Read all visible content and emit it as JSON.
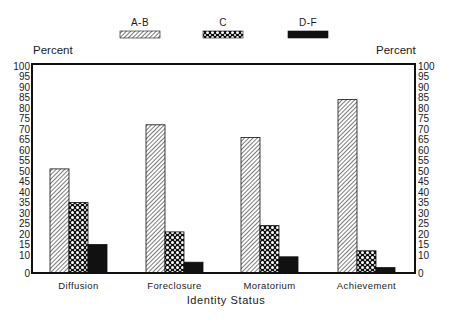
{
  "chart_data": {
    "type": "bar",
    "title": "",
    "xlabel": "Identity Status",
    "ylabel": "Percent",
    "ylabel_right": "Percent",
    "categories": [
      "Diffusion",
      "Foreclosure",
      "Moratorium",
      "Achievement"
    ],
    "series": [
      {
        "name": "A-B",
        "pattern": "diagonal-hatch",
        "values": [
          51,
          72,
          66,
          84
        ]
      },
      {
        "name": "C",
        "pattern": "crosshatch",
        "values": [
          35,
          21,
          24,
          12
        ]
      },
      {
        "name": "D-F",
        "pattern": "solid-black",
        "values": [
          15,
          6,
          9,
          3
        ]
      }
    ],
    "ylim": [
      0,
      100
    ],
    "yticks_left": [
      0,
      10,
      15,
      20,
      25,
      30,
      35,
      40,
      45,
      50,
      55,
      60,
      65,
      70,
      75,
      80,
      85,
      90,
      95,
      100
    ],
    "yticks_right": [
      0,
      10,
      15,
      20,
      25,
      30,
      35,
      40,
      45,
      50,
      55,
      60,
      65,
      70,
      75,
      80,
      85,
      90,
      95,
      100
    ],
    "axis_break": "between 0 and 10",
    "grid": false,
    "legend_position": "top",
    "colors": {
      "ink": "#111111",
      "background": "#ffffff"
    }
  }
}
